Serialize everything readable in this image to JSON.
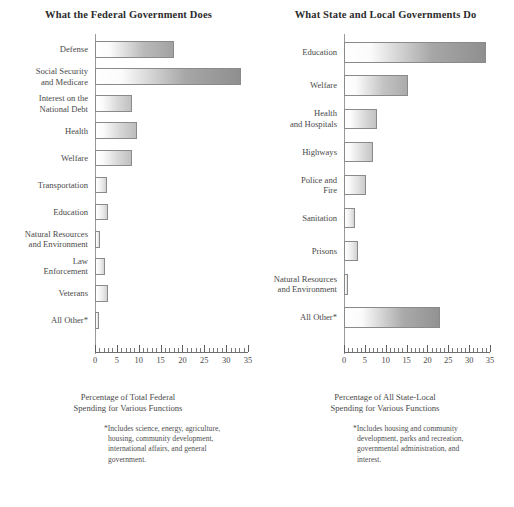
{
  "chart_data": [
    {
      "type": "bar",
      "orientation": "horizontal",
      "title": "What the Federal Government Does",
      "xlabel": "Percentage of Total Federal\nSpending for Various Functions",
      "ylabel": "",
      "xlim": [
        0,
        35
      ],
      "xticks": [
        0,
        5,
        10,
        15,
        20,
        25,
        30,
        35
      ],
      "xtick_labels": [
        "0",
        "5",
        "10",
        "15",
        "20",
        "25",
        "30",
        "35"
      ],
      "minor_tick_step": 1,
      "grid": false,
      "legend": false,
      "categories": [
        "Defense",
        "Social Security\nand Medicare",
        "Interest on the\nNational Debt",
        "Health",
        "Welfare",
        "Transportation",
        "Education",
        "Natural Resources\nand Environment",
        "Law\nEnforcement",
        "Veterans",
        "All Other*"
      ],
      "values": [
        18.0,
        33.5,
        8.5,
        9.5,
        8.5,
        2.7,
        3.0,
        1.2,
        2.3,
        3.0,
        1.0
      ],
      "footnote": "*Includes science, energy, agriculture,\nhousing, community development,\ninternational affairs, and general\ngovernment."
    },
    {
      "type": "bar",
      "orientation": "horizontal",
      "title": "What State and Local Governments Do",
      "xlabel": "Percentage of All State-Local\nSpending for Various Functions",
      "ylabel": "",
      "xlim": [
        0,
        35
      ],
      "xticks": [
        0,
        5,
        10,
        15,
        20,
        25,
        30,
        35
      ],
      "xtick_labels": [
        "0",
        "5",
        "10",
        "15",
        "20",
        "25",
        "30",
        "35"
      ],
      "minor_tick_step": 1,
      "grid": false,
      "legend": false,
      "categories": [
        "Education",
        "Welfare",
        "Health\nand Hospitals",
        "Highways",
        "Police and\nFire",
        "Sanitation",
        "Prisons",
        "Natural Resources\nand Environment",
        "All Other*"
      ],
      "values": [
        34.0,
        15.3,
        8.0,
        7.0,
        5.3,
        2.7,
        3.3,
        1.0,
        23.0
      ],
      "footnote": "*Includes housing and community\ndevelopment, parks and recreation,\ngovernmental administration, and\ninterest."
    }
  ],
  "panels": [
    {
      "title": "What the Federal Government Does",
      "caption": "Percentage of Total Federal\nSpending for Various Functions",
      "footnote": "*Includes science, energy, agriculture,\nhousing, community development,\ninternational affairs, and general\ngovernment.",
      "tick_labels": [
        "0",
        "5",
        "10",
        "15",
        "20",
        "25",
        "30",
        "35"
      ],
      "bars": [
        {
          "label": "Defense",
          "value": 18.0
        },
        {
          "label": "Social Security\nand Medicare",
          "value": 33.5
        },
        {
          "label": "Interest on the\nNational Debt",
          "value": 8.5
        },
        {
          "label": "Health",
          "value": 9.5
        },
        {
          "label": "Welfare",
          "value": 8.5
        },
        {
          "label": "Transportation",
          "value": 2.7
        },
        {
          "label": "Education",
          "value": 3.0
        },
        {
          "label": "Natural Resources\nand Environment",
          "value": 1.2
        },
        {
          "label": "Law\nEnforcement",
          "value": 2.3
        },
        {
          "label": "Veterans",
          "value": 3.0
        },
        {
          "label": "All Other*",
          "value": 1.0
        }
      ]
    },
    {
      "title": "What State and Local Governments Do",
      "caption": "Percentage of All State-Local\nSpending for Various Functions",
      "footnote": "*Includes housing and community\ndevelopment, parks and recreation,\ngovernmental administration, and\ninterest.",
      "tick_labels": [
        "0",
        "5",
        "10",
        "15",
        "20",
        "25",
        "30",
        "35"
      ],
      "bars": [
        {
          "label": "Education",
          "value": 34.0
        },
        {
          "label": "Welfare",
          "value": 15.3
        },
        {
          "label": "Health\nand Hospitals",
          "value": 8.0
        },
        {
          "label": "Highways",
          "value": 7.0
        },
        {
          "label": "Police and\nFire",
          "value": 5.3
        },
        {
          "label": "Sanitation",
          "value": 2.7
        },
        {
          "label": "Prisons",
          "value": 3.3
        },
        {
          "label": "Natural Resources\nand Environment",
          "value": 1.0
        },
        {
          "label": "All Other*",
          "value": 23.0
        }
      ]
    }
  ],
  "style": {
    "bar_border": "#8a8a8a",
    "bar_fill_light": "#ffffff",
    "bar_fill_dark": "#9a9a9a",
    "axis_color": "#6f6f6f",
    "text_color": "#4a4a4a"
  }
}
